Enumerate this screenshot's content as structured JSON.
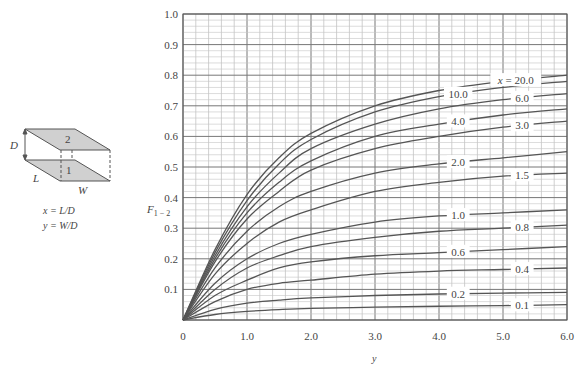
{
  "chart_data": {
    "type": "line",
    "title": "",
    "xlabel": "y",
    "ylabel": "F₁₋₂",
    "ylabel_main": "F",
    "ylabel_sub": "1 − 2",
    "xlim": [
      0,
      6.0
    ],
    "ylim": [
      0,
      1.0
    ],
    "x_ticks": [
      "0",
      "1.0",
      "2.0",
      "3.0",
      "4.0",
      "5.0",
      "6.0"
    ],
    "y_ticks": [
      "0.1",
      "0.2",
      "0.3",
      "0.4",
      "0.5",
      "0.6",
      "0.7",
      "0.8",
      "0.9",
      "1.0"
    ],
    "grid": true,
    "x": [
      0,
      0.5,
      1.0,
      1.5,
      2.0,
      3.0,
      4.0,
      5.0,
      6.0
    ],
    "series": [
      {
        "name": "x = 20.0",
        "label": "x = 20.0",
        "values": [
          0,
          0.23,
          0.41,
          0.53,
          0.61,
          0.7,
          0.75,
          0.78,
          0.8
        ]
      },
      {
        "name": "10.0",
        "label": "10.0",
        "values": [
          0,
          0.22,
          0.39,
          0.51,
          0.59,
          0.68,
          0.73,
          0.76,
          0.78
        ]
      },
      {
        "name": "6.0",
        "label": "6.0",
        "values": [
          0,
          0.21,
          0.37,
          0.48,
          0.56,
          0.64,
          0.69,
          0.72,
          0.74
        ]
      },
      {
        "name": "4.0",
        "label": "4.0",
        "values": [
          0,
          0.2,
          0.35,
          0.45,
          0.52,
          0.6,
          0.64,
          0.67,
          0.69
        ]
      },
      {
        "name": "3.0",
        "label": "3.0",
        "values": [
          0,
          0.19,
          0.33,
          0.42,
          0.49,
          0.56,
          0.6,
          0.63,
          0.65
        ]
      },
      {
        "name": "2.0",
        "label": "2.0",
        "values": [
          0,
          0.17,
          0.29,
          0.37,
          0.42,
          0.48,
          0.51,
          0.53,
          0.55
        ]
      },
      {
        "name": "1.5",
        "label": "1.5",
        "values": [
          0,
          0.15,
          0.25,
          0.32,
          0.36,
          0.42,
          0.45,
          0.47,
          0.48
        ]
      },
      {
        "name": "1.0",
        "label": "1.0",
        "values": [
          0,
          0.12,
          0.2,
          0.25,
          0.28,
          0.32,
          0.34,
          0.35,
          0.36
        ]
      },
      {
        "name": "0.8",
        "label": "0.8",
        "values": [
          0,
          0.1,
          0.17,
          0.21,
          0.24,
          0.27,
          0.29,
          0.3,
          0.31
        ]
      },
      {
        "name": "0.6",
        "label": "0.6",
        "values": [
          0,
          0.08,
          0.13,
          0.17,
          0.19,
          0.21,
          0.22,
          0.23,
          0.24
        ]
      },
      {
        "name": "0.4",
        "label": "0.4",
        "values": [
          0,
          0.06,
          0.1,
          0.12,
          0.13,
          0.15,
          0.16,
          0.165,
          0.17
        ]
      },
      {
        "name": "0.2",
        "label": "0.2",
        "values": [
          0,
          0.035,
          0.055,
          0.065,
          0.072,
          0.08,
          0.085,
          0.088,
          0.09
        ]
      },
      {
        "name": "0.1",
        "label": "0.1",
        "values": [
          0,
          0.018,
          0.028,
          0.034,
          0.038,
          0.042,
          0.045,
          0.047,
          0.05
        ]
      }
    ],
    "legend_position": "inline right"
  },
  "diagram": {
    "top_plate_label": "2",
    "bottom_plate_label": "1",
    "dim_d": "D",
    "dim_l": "L",
    "dim_w": "W",
    "def_x": "x = L/D",
    "def_y": "y = W/D"
  }
}
